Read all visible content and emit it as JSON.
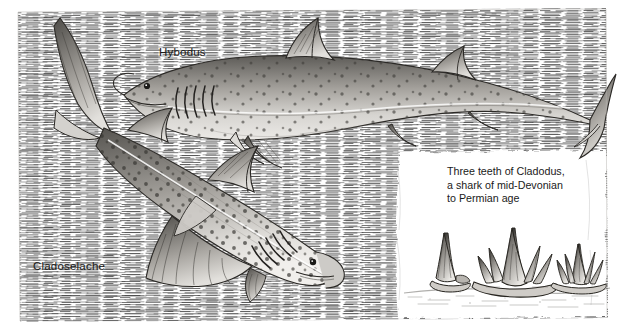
{
  "plate": {
    "title_labels": {
      "hybodus": "Hybodus",
      "cladoselache": "Cladoselache"
    },
    "caption": {
      "line1": "Three teeth of Cladodus,",
      "line2": "a shark of mid-Devonian",
      "line3": "to Permian age"
    },
    "colors": {
      "ink": "#1a1a1a",
      "paper": "#ffffff",
      "hatch": "#3a3a3a",
      "body_light": "#d8d6d2",
      "body_mid": "#9a9792",
      "body_dark": "#4a4844"
    },
    "figures": {
      "shark_upper": "hybodus-shark",
      "shark_lower": "cladoselache-shark",
      "teeth": [
        "cladodus-tooth-single-cusp",
        "cladodus-tooth-multi-cusp",
        "cladodus-tooth-comb"
      ]
    },
    "background": "horizontal-hatch-water-texture"
  }
}
